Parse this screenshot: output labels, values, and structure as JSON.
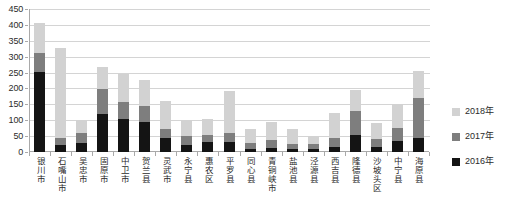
{
  "chart_data": {
    "type": "bar",
    "subtype": "stacked-column",
    "title": "",
    "xlabel": "",
    "ylabel": "",
    "ylim": [
      0,
      450
    ],
    "ytick_step": 50,
    "yticks": [
      0,
      50,
      100,
      150,
      200,
      250,
      300,
      350,
      400,
      450
    ],
    "grid": true,
    "legend_position": "right",
    "categories": [
      "银川市",
      "石嘴山市",
      "吴忠市",
      "固原市",
      "中卫市",
      "贺兰县",
      "灵武市",
      "永宁县",
      "惠农区",
      "平罗县",
      "同心县",
      "青铜峡市",
      "盐池县",
      "泾源县",
      "西吉县",
      "隆德县",
      "沙坡头区",
      "中宁县",
      "海原县"
    ],
    "series": [
      {
        "name": "2016年",
        "color": "#141414",
        "values": [
          253,
          21,
          29,
          120,
          103,
          96,
          45,
          22,
          31,
          31,
          10,
          13,
          10,
          8,
          15,
          55,
          17,
          35,
          45
        ]
      },
      {
        "name": "2017年",
        "color": "#7e7e7e",
        "values": [
          60,
          22,
          30,
          77,
          54,
          48,
          26,
          27,
          21,
          29,
          19,
          24,
          15,
          17,
          30,
          75,
          23,
          42,
          125
        ]
      },
      {
        "name": "2018年",
        "color": "#d2d2d2",
        "values": [
          92,
          284,
          42,
          72,
          89,
          84,
          90,
          53,
          53,
          133,
          44,
          59,
          47,
          25,
          77,
          65,
          50,
          73,
          85
        ]
      }
    ],
    "totals": [
      405,
      327,
      101,
      269,
      246,
      228,
      161,
      102,
      105,
      193,
      73,
      96,
      72,
      50,
      122,
      195,
      90,
      150,
      255
    ]
  },
  "legend": {
    "items": [
      {
        "label": "2018年",
        "color": "#d2d2d2"
      },
      {
        "label": "2017年",
        "color": "#7e7e7e"
      },
      {
        "label": "2016年",
        "color": "#141414"
      }
    ]
  },
  "axis": {
    "y_tick_labels": [
      "450",
      "400",
      "350",
      "300",
      "250",
      "200",
      "150",
      "100",
      "50",
      "0"
    ]
  }
}
